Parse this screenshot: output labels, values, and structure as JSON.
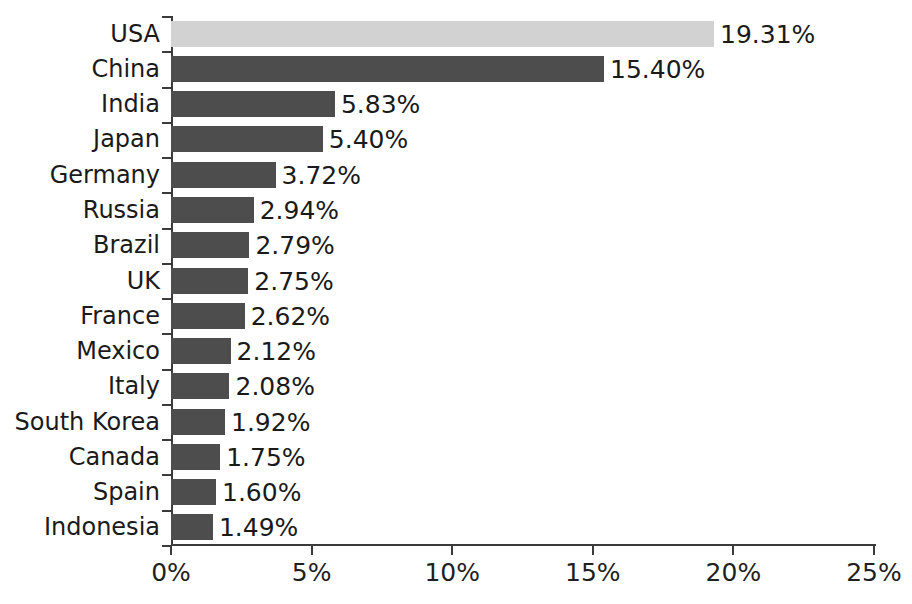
{
  "chart_data": {
    "type": "bar",
    "orientation": "horizontal",
    "title": "Share of Global ... (partially cut off)",
    "xlabel": "",
    "ylabel": "",
    "xlim": [
      0,
      25
    ],
    "xtick_labels": [
      "0%",
      "5%",
      "10%",
      "15%",
      "20%",
      "25%"
    ],
    "xtick_values": [
      0,
      5,
      10,
      15,
      20,
      25
    ],
    "grid": false,
    "legend": "none",
    "value_suffix": "%",
    "categories": [
      "USA",
      "China",
      "India",
      "Japan",
      "Germany",
      "Russia",
      "Brazil",
      "UK",
      "France",
      "Mexico",
      "Italy",
      "South Korea",
      "Canada",
      "Spain",
      "Indonesia"
    ],
    "values": [
      19.31,
      15.4,
      5.83,
      5.4,
      3.72,
      2.94,
      2.79,
      2.75,
      2.62,
      2.12,
      2.08,
      1.92,
      1.75,
      1.6,
      1.49
    ],
    "value_labels": [
      "19.31%",
      "15.40%",
      "5.83%",
      "5.40%",
      "3.72%",
      "2.94%",
      "2.79%",
      "2.75%",
      "2.62%",
      "2.12%",
      "2.08%",
      "1.92%",
      "1.75%",
      "1.60%",
      "1.49%"
    ],
    "highlight_index": 0,
    "colors": {
      "bar": "#4d4d4d",
      "bar_highlight": "#d2d2d2",
      "axis": "#3b3b3b",
      "text": "#1a1a1a",
      "background": "#ffffff"
    }
  }
}
